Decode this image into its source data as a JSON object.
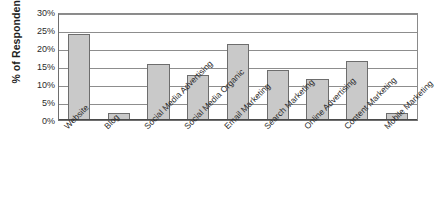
{
  "chart_data": {
    "type": "bar",
    "title": "",
    "xlabel": "",
    "ylabel": "% of Respondents",
    "ylim": [
      0,
      30
    ],
    "ytick_labels": [
      "30%",
      "25%",
      "20%",
      "15%",
      "10%",
      "5%",
      "0%"
    ],
    "ytick_values": [
      30,
      25,
      20,
      15,
      10,
      5,
      0
    ],
    "grid": true,
    "legend": "none",
    "categories": [
      "Website",
      "Blog",
      "Social Media Advertising",
      "Social Media Organic",
      "Email Marketing",
      "Search Marketing",
      "Online Advertising",
      "Content Marketing",
      "Mobile Marketing"
    ],
    "values": [
      24,
      2,
      15.5,
      12.5,
      21,
      14,
      11.5,
      16.5,
      2
    ],
    "bar_color": "#c9c9c9",
    "bar_border_color": "#6d6d6d",
    "gridline_color": "#8d8d8d",
    "axis_color": "#4a4a4a"
  }
}
